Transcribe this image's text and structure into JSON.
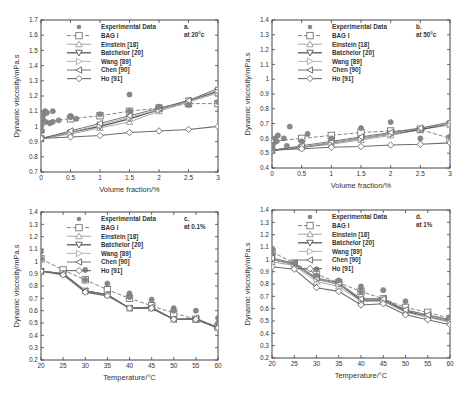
{
  "series_names": [
    "Experimental Data",
    "BAG I",
    "Einstein [18]",
    "Batchelor [20]",
    "Wang [89]",
    "Chen [90]",
    "Ho [91]"
  ],
  "chart_data": [
    {
      "id": "a",
      "type": "line",
      "panel_label": "a.",
      "condition": "at 20°c",
      "xlabel": "Volume fraction/%",
      "ylabel": "Dynamic viscosity/mPa.s",
      "xlim": [
        0,
        3
      ],
      "ylim": [
        0.7,
        1.7
      ],
      "xticks": [
        0,
        0.5,
        1,
        1.5,
        2,
        2.5,
        3
      ],
      "xtick_labels": [
        "0",
        "0.5",
        "1",
        "1.5",
        "2",
        "2.5",
        "3"
      ],
      "yticks": [
        0.7,
        0.8,
        0.9,
        1.0,
        1.1,
        1.2,
        1.3,
        1.4,
        1.5,
        1.6,
        1.7
      ],
      "ytick_labels": [
        "0.7",
        "0.8",
        "0.9",
        "1",
        "1.1",
        "1.2",
        "1.3",
        "1.4",
        "1.5",
        "1.6",
        "1.7"
      ],
      "experimental": [
        [
          0,
          1.0
        ],
        [
          0,
          1.02
        ],
        [
          0.02,
          0.97
        ],
        [
          0.03,
          1.05
        ],
        [
          0.05,
          1.08
        ],
        [
          0.07,
          1.1
        ],
        [
          0.08,
          1.03
        ],
        [
          0.1,
          1.09
        ],
        [
          0.15,
          1.02
        ],
        [
          0.2,
          1.1
        ],
        [
          0.2,
          1.03
        ],
        [
          0.3,
          1.04
        ],
        [
          0.5,
          1.07
        ],
        [
          0.5,
          1.06
        ],
        [
          0.6,
          1.05
        ],
        [
          1.0,
          1.08
        ],
        [
          1.5,
          1.1
        ],
        [
          1.5,
          1.21
        ],
        [
          2.0,
          1.13
        ],
        [
          2.5,
          1.14
        ],
        [
          3.0,
          1.16
        ]
      ],
      "series": [
        {
          "name": "BAG I",
          "x": [
            0,
            0.5,
            1,
            1.5,
            2,
            2.5,
            3
          ],
          "y": [
            1.03,
            1.05,
            1.07,
            1.1,
            1.12,
            1.15,
            1.15
          ]
        },
        {
          "name": "Einstein [18]",
          "x": [
            0,
            0.5,
            1,
            1.5,
            2,
            2.5,
            3
          ],
          "y": [
            0.92,
            0.95,
            0.99,
            1.03,
            1.1,
            1.16,
            1.22
          ]
        },
        {
          "name": "Batchelor [20]",
          "x": [
            0,
            0.5,
            1,
            1.5,
            2,
            2.5,
            3
          ],
          "y": [
            0.92,
            0.96,
            1.0,
            1.05,
            1.11,
            1.17,
            1.23
          ]
        },
        {
          "name": "Wang [89]",
          "x": [
            0,
            0.5,
            1,
            1.5,
            2,
            2.5,
            3
          ],
          "y": [
            0.92,
            0.96,
            1.01,
            1.06,
            1.11,
            1.17,
            1.24
          ]
        },
        {
          "name": "Chen [90]",
          "x": [
            0,
            0.5,
            1,
            1.5,
            2,
            2.5,
            3
          ],
          "y": [
            0.92,
            0.97,
            1.02,
            1.07,
            1.12,
            1.17,
            1.25
          ]
        },
        {
          "name": "Ho [91]",
          "x": [
            0,
            0.5,
            1,
            1.5,
            2,
            2.5,
            3
          ],
          "y": [
            0.92,
            0.93,
            0.94,
            0.96,
            0.97,
            0.98,
            1.0
          ]
        }
      ]
    },
    {
      "id": "b",
      "type": "line",
      "panel_label": "b.",
      "condition": "at 50°c",
      "xlabel": "Volume fraction/%",
      "ylabel": "Dynamic viscosity/mPa.s",
      "xlim": [
        0,
        3
      ],
      "ylim": [
        0.4,
        1.4
      ],
      "xticks": [
        0,
        0.5,
        1,
        1.5,
        2,
        2.5,
        3
      ],
      "xtick_labels": [
        "0",
        "0.5",
        "1",
        "1.5",
        "2",
        "2.5",
        "3"
      ],
      "yticks": [
        0.4,
        0.5,
        0.6,
        0.7,
        0.8,
        0.9,
        1.0,
        1.1,
        1.2,
        1.3,
        1.4
      ],
      "ytick_labels": [
        "0.4",
        "0.5",
        "0.6",
        "0.7",
        "0.8",
        "0.9",
        "1",
        "1.1",
        "1.2",
        "1.3",
        "1.4"
      ],
      "experimental": [
        [
          0,
          0.53
        ],
        [
          0.02,
          0.56
        ],
        [
          0.05,
          0.6
        ],
        [
          0.08,
          0.58
        ],
        [
          0.1,
          0.62
        ],
        [
          0.2,
          0.6
        ],
        [
          0.25,
          0.55
        ],
        [
          0.3,
          0.68
        ],
        [
          0.5,
          0.58
        ],
        [
          0.6,
          0.63
        ],
        [
          1.0,
          0.6
        ],
        [
          1.5,
          0.67
        ],
        [
          2.0,
          0.71
        ],
        [
          2.5,
          0.6
        ],
        [
          3.0,
          0.61
        ]
      ],
      "series": [
        {
          "name": "BAG I",
          "x": [
            0,
            0.5,
            1,
            1.5,
            2,
            2.5,
            3
          ],
          "y": [
            0.58,
            0.6,
            0.62,
            0.64,
            0.65,
            0.66,
            0.6
          ]
        },
        {
          "name": "Einstein [18]",
          "x": [
            0,
            0.5,
            1,
            1.5,
            2,
            2.5,
            3
          ],
          "y": [
            0.52,
            0.54,
            0.56,
            0.59,
            0.62,
            0.66,
            0.69
          ]
        },
        {
          "name": "Batchelor [20]",
          "x": [
            0,
            0.5,
            1,
            1.5,
            2,
            2.5,
            3
          ],
          "y": [
            0.52,
            0.54,
            0.57,
            0.6,
            0.63,
            0.66,
            0.7
          ]
        },
        {
          "name": "Wang [89]",
          "x": [
            0,
            0.5,
            1,
            1.5,
            2,
            2.5,
            3
          ],
          "y": [
            0.52,
            0.54,
            0.57,
            0.6,
            0.63,
            0.67,
            0.7
          ]
        },
        {
          "name": "Chen [90]",
          "x": [
            0,
            0.5,
            1,
            1.5,
            2,
            2.5,
            3
          ],
          "y": [
            0.52,
            0.55,
            0.58,
            0.61,
            0.64,
            0.67,
            0.71
          ]
        },
        {
          "name": "Ho [91]",
          "x": [
            0,
            0.5,
            1,
            1.5,
            2,
            2.5,
            3
          ],
          "y": [
            0.52,
            0.53,
            0.54,
            0.545,
            0.555,
            0.56,
            0.57
          ]
        }
      ]
    },
    {
      "id": "c",
      "type": "line",
      "panel_label": "c.",
      "condition": "at 0.1%",
      "xlabel": "Temperature/°C",
      "ylabel": "Dynamic viscosity/mPa.s",
      "xlim": [
        20,
        60
      ],
      "ylim": [
        0.2,
        1.4
      ],
      "xticks": [
        20,
        25,
        30,
        35,
        40,
        45,
        50,
        55,
        60
      ],
      "xtick_labels": [
        "20",
        "25",
        "30",
        "35",
        "40",
        "45",
        "50",
        "55",
        "60"
      ],
      "yticks": [
        0.2,
        0.3,
        0.4,
        0.5,
        0.6,
        0.7,
        0.8,
        0.9,
        1.0,
        1.1,
        1.2,
        1.3,
        1.4
      ],
      "ytick_labels": [
        "0.2",
        "0.3",
        "0.4",
        "0.5",
        "0.6",
        "0.7",
        "0.8",
        "0.9",
        "1",
        "1.1",
        "1.2",
        "1.3",
        "1.4"
      ],
      "experimental": [
        [
          20,
          1.08
        ],
        [
          20,
          1.02
        ],
        [
          30,
          0.93
        ],
        [
          30,
          0.85
        ],
        [
          35,
          0.82
        ],
        [
          40,
          0.74
        ],
        [
          40,
          0.71
        ],
        [
          45,
          0.69
        ],
        [
          50,
          0.62
        ],
        [
          50,
          0.6
        ],
        [
          55,
          0.6
        ],
        [
          60,
          0.54
        ],
        [
          60,
          0.5
        ]
      ],
      "series": [
        {
          "name": "BAG I",
          "x": [
            20,
            25,
            30,
            35,
            40,
            45,
            50,
            55,
            60
          ],
          "y": [
            1.02,
            0.93,
            0.85,
            0.77,
            0.7,
            0.64,
            0.58,
            0.53,
            0.47
          ]
        },
        {
          "name": "Einstein [18]",
          "x": [
            20,
            25,
            30,
            35,
            40,
            45,
            50,
            55,
            60
          ],
          "y": [
            0.92,
            0.9,
            0.76,
            0.73,
            0.62,
            0.62,
            0.53,
            0.53,
            0.46
          ]
        },
        {
          "name": "Batchelor [20]",
          "x": [
            20,
            25,
            30,
            35,
            40,
            45,
            50,
            55,
            60
          ],
          "y": [
            0.92,
            0.9,
            0.76,
            0.73,
            0.62,
            0.62,
            0.53,
            0.53,
            0.46
          ]
        },
        {
          "name": "Wang [89]",
          "x": [
            20,
            25,
            30,
            35,
            40,
            45,
            50,
            55,
            60
          ],
          "y": [
            0.92,
            0.9,
            0.76,
            0.73,
            0.62,
            0.62,
            0.53,
            0.53,
            0.46
          ]
        },
        {
          "name": "Chen [90]",
          "x": [
            20,
            25,
            30,
            35,
            40,
            45,
            50,
            55,
            60
          ],
          "y": [
            0.92,
            0.9,
            0.76,
            0.73,
            0.62,
            0.63,
            0.53,
            0.54,
            0.46
          ]
        },
        {
          "name": "Ho [91]",
          "x": [
            20,
            25,
            30,
            35,
            40,
            45,
            50,
            55,
            60
          ],
          "y": [
            0.92,
            0.89,
            0.75,
            0.72,
            0.62,
            0.62,
            0.53,
            0.53,
            0.46
          ]
        }
      ]
    },
    {
      "id": "d",
      "type": "line",
      "panel_label": "d.",
      "condition": "at 1%",
      "xlabel": "Temperature/°C",
      "ylabel": "Dynamic viscosity/mPa.s",
      "xlim": [
        20,
        60
      ],
      "ylim": [
        0.2,
        1.4
      ],
      "xticks": [
        20,
        25,
        30,
        35,
        40,
        45,
        50,
        55,
        60
      ],
      "xtick_labels": [
        "20",
        "25",
        "30",
        "35",
        "40",
        "45",
        "50",
        "55",
        "60"
      ],
      "yticks": [
        0.2,
        0.3,
        0.4,
        0.5,
        0.6,
        0.7,
        0.8,
        0.9,
        1.0,
        1.1,
        1.2,
        1.3,
        1.4
      ],
      "ytick_labels": [
        "0.2",
        "0.3",
        "0.4",
        "0.5",
        "0.6",
        "0.7",
        "0.8",
        "0.9",
        "1",
        "1.1",
        "1.2",
        "1.3",
        "1.4"
      ],
      "experimental": [
        [
          20,
          1.08
        ],
        [
          20,
          1.05
        ],
        [
          25,
          0.97
        ],
        [
          30,
          0.92
        ],
        [
          30,
          0.87
        ],
        [
          35,
          0.83
        ],
        [
          40,
          0.78
        ],
        [
          40,
          0.74
        ],
        [
          45,
          0.75
        ],
        [
          50,
          0.66
        ],
        [
          60,
          0.53
        ]
      ],
      "series": [
        {
          "name": "BAG I",
          "x": [
            20,
            25,
            30,
            35,
            40,
            45,
            50,
            55,
            60
          ],
          "y": [
            1.06,
            0.97,
            0.88,
            0.81,
            0.74,
            0.68,
            0.61,
            0.57,
            0.52
          ]
        },
        {
          "name": "Einstein [18]",
          "x": [
            20,
            25,
            30,
            35,
            40,
            45,
            50,
            55,
            60
          ],
          "y": [
            0.98,
            0.95,
            0.82,
            0.78,
            0.66,
            0.66,
            0.57,
            0.53,
            0.49
          ]
        },
        {
          "name": "Batchelor [20]",
          "x": [
            20,
            25,
            30,
            35,
            40,
            45,
            50,
            55,
            60
          ],
          "y": [
            1.0,
            0.96,
            0.84,
            0.8,
            0.67,
            0.67,
            0.58,
            0.54,
            0.5
          ]
        },
        {
          "name": "Wang [89]",
          "x": [
            20,
            25,
            30,
            35,
            40,
            45,
            50,
            55,
            60
          ],
          "y": [
            1.0,
            0.96,
            0.84,
            0.8,
            0.68,
            0.68,
            0.59,
            0.54,
            0.5
          ]
        },
        {
          "name": "Chen [90]",
          "x": [
            20,
            25,
            30,
            35,
            40,
            45,
            50,
            55,
            60
          ],
          "y": [
            1.01,
            0.97,
            0.85,
            0.81,
            0.68,
            0.68,
            0.59,
            0.55,
            0.51
          ]
        },
        {
          "name": "Ho [91]",
          "x": [
            20,
            25,
            30,
            35,
            40,
            45,
            50,
            55,
            60
          ],
          "y": [
            0.94,
            0.92,
            0.77,
            0.74,
            0.63,
            0.64,
            0.55,
            0.51,
            0.47
          ]
        }
      ]
    }
  ]
}
